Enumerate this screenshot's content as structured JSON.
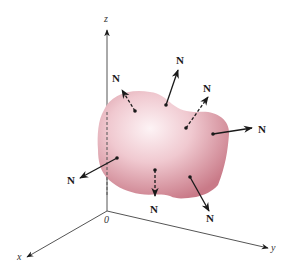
{
  "figure": {
    "axes": {
      "x_label": "x",
      "y_label": "y",
      "z_label": "z",
      "origin_label": "0"
    },
    "normal_label": "N",
    "normals": [
      {
        "id": "upper-left",
        "label": "N",
        "dashed": true
      },
      {
        "id": "top",
        "label": "N",
        "dashed": false
      },
      {
        "id": "upper-right-inner",
        "label": "N",
        "dashed": true
      },
      {
        "id": "right",
        "label": "N",
        "dashed": false
      },
      {
        "id": "left",
        "label": "N",
        "dashed": false
      },
      {
        "id": "bottom-center",
        "label": "N",
        "dashed": true
      },
      {
        "id": "bottom-right",
        "label": "N",
        "dashed": false
      }
    ],
    "colors": {
      "surface_edge": "#c97a88",
      "surface_center": "#fdf3f5",
      "axis": "#444444",
      "arrow": "#1a1a1a"
    }
  }
}
